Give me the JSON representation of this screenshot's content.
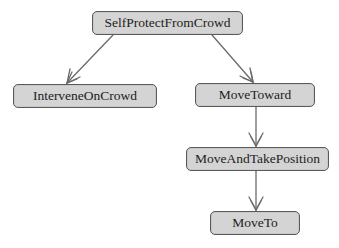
{
  "diagram": {
    "type": "tree",
    "colors": {
      "node_fill": "#d4d4d4",
      "node_border": "#5a5a5a",
      "edge": "#6a6a6a",
      "text": "#222222"
    },
    "nodes": [
      {
        "id": "n0",
        "label": "SelfProtectFromCrowd",
        "x": 92,
        "y": 11,
        "w": 151,
        "h": 24
      },
      {
        "id": "n1",
        "label": "InterveneOnCrowd",
        "x": 13,
        "y": 84,
        "w": 144,
        "h": 24
      },
      {
        "id": "n2",
        "label": "MoveToward",
        "x": 195,
        "y": 83,
        "w": 120,
        "h": 24
      },
      {
        "id": "n3",
        "label": "MoveAndTakePosition",
        "x": 186,
        "y": 147,
        "w": 143,
        "h": 24
      },
      {
        "id": "n4",
        "label": "MoveTo",
        "x": 210,
        "y": 211,
        "w": 90,
        "h": 24
      }
    ],
    "edges": [
      {
        "from": "SelfProtectFromCrowd",
        "to": "InterveneOnCrowd"
      },
      {
        "from": "SelfProtectFromCrowd",
        "to": "MoveToward"
      },
      {
        "from": "MoveToward",
        "to": "MoveAndTakePosition"
      },
      {
        "from": "MoveAndTakePosition",
        "to": "MoveTo"
      }
    ]
  }
}
